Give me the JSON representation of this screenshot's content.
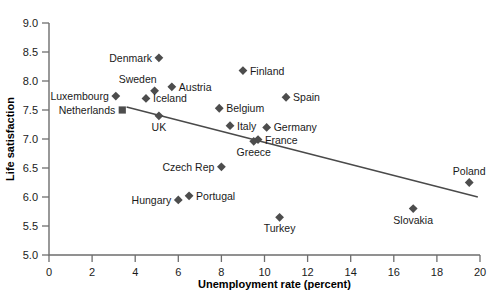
{
  "chart_data": {
    "type": "scatter",
    "title": "",
    "xlabel": "Unemployment rate (percent)",
    "ylabel": "Life satisfaction",
    "xlim": [
      0,
      20
    ],
    "ylim": [
      5.0,
      9.0
    ],
    "grid": false,
    "legend": "none",
    "xticks": [
      "0",
      "2",
      "4",
      "6",
      "8",
      "10",
      "12",
      "14",
      "16",
      "18",
      "20"
    ],
    "yticks": [
      "5.0",
      "5.5",
      "6.0",
      "6.5",
      "7.0",
      "7.5",
      "8.0",
      "8.5",
      "9.0"
    ],
    "marker_color": "#4d4d4d",
    "line_color": "#4a4a4a",
    "points": [
      {
        "label": "Denmark",
        "x": 5.1,
        "y": 8.4,
        "label_side": "left",
        "marker": "diamond"
      },
      {
        "label": "Finland",
        "x": 9.0,
        "y": 8.18,
        "label_side": "right",
        "marker": "diamond"
      },
      {
        "label": "Austria",
        "x": 5.7,
        "y": 7.9,
        "label_side": "right",
        "marker": "diamond"
      },
      {
        "label": "Sweden",
        "x": 4.9,
        "y": 7.83,
        "label_side": "above-left",
        "marker": "diamond"
      },
      {
        "label": "Luxembourg",
        "x": 3.1,
        "y": 7.74,
        "label_side": "left",
        "marker": "diamond"
      },
      {
        "label": "Iceland",
        "x": 4.5,
        "y": 7.7,
        "label_side": "right",
        "marker": "diamond"
      },
      {
        "label": "Spain",
        "x": 11.0,
        "y": 7.72,
        "label_side": "right",
        "marker": "diamond"
      },
      {
        "label": "Netherlands",
        "x": 3.4,
        "y": 7.5,
        "label_side": "left",
        "marker": "square"
      },
      {
        "label": "Belgium",
        "x": 7.9,
        "y": 7.53,
        "label_side": "right",
        "marker": "diamond"
      },
      {
        "label": "UK",
        "x": 5.1,
        "y": 7.4,
        "label_side": "below",
        "marker": "diamond"
      },
      {
        "label": "Italy",
        "x": 8.4,
        "y": 7.23,
        "label_side": "right",
        "marker": "diamond"
      },
      {
        "label": "Germany",
        "x": 10.1,
        "y": 7.2,
        "label_side": "right",
        "marker": "diamond"
      },
      {
        "label": "France",
        "x": 9.7,
        "y": 6.99,
        "label_side": "right",
        "marker": "diamond"
      },
      {
        "label": "Greece",
        "x": 9.5,
        "y": 6.96,
        "label_side": "below",
        "marker": "diamond"
      },
      {
        "label": "Czech Rep",
        "x": 8.0,
        "y": 6.52,
        "label_side": "left",
        "marker": "diamond"
      },
      {
        "label": "Poland",
        "x": 19.5,
        "y": 6.25,
        "label_side": "above",
        "marker": "diamond"
      },
      {
        "label": "Portugal",
        "x": 6.5,
        "y": 6.02,
        "label_side": "right",
        "marker": "diamond"
      },
      {
        "label": "Hungary",
        "x": 6.0,
        "y": 5.95,
        "label_side": "left",
        "marker": "diamond"
      },
      {
        "label": "Slovakia",
        "x": 16.9,
        "y": 5.8,
        "label_side": "below",
        "marker": "diamond"
      },
      {
        "label": "Turkey",
        "x": 10.7,
        "y": 5.65,
        "label_side": "below",
        "marker": "diamond"
      }
    ],
    "trend_line": {
      "x0": 3.6,
      "y0": 7.55,
      "x1": 19.9,
      "y1": 6.0
    }
  }
}
